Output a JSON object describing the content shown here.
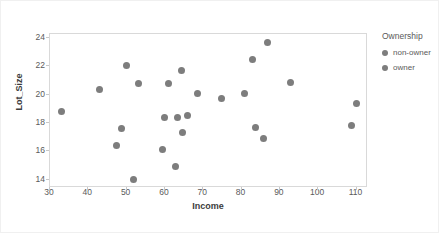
{
  "chart_data": {
    "type": "scatter",
    "title": "",
    "xlabel": "Income",
    "ylabel": "Lot_Size",
    "xlim": [
      30,
      113
    ],
    "ylim": [
      13.4,
      24.3
    ],
    "xticks": [
      "30",
      "40",
      "50",
      "60",
      "70",
      "80",
      "90",
      "100",
      "110"
    ],
    "yticks": [
      "14",
      "16",
      "18",
      "20",
      "22",
      "24"
    ],
    "grid": false,
    "legend": {
      "title": "Ownership",
      "position": "right",
      "entries": [
        {
          "label": "non-owner",
          "color": "#7d7d7d"
        },
        {
          "label": "owner",
          "color": "#7d7d7d"
        }
      ]
    },
    "marker_color": "#7d7d7d",
    "series": [
      {
        "name": "Ownership",
        "points": [
          {
            "x": 33.0,
            "y": 18.8
          },
          {
            "x": 43.0,
            "y": 20.4
          },
          {
            "x": 47.4,
            "y": 16.4
          },
          {
            "x": 48.6,
            "y": 17.6
          },
          {
            "x": 50.0,
            "y": 22.1
          },
          {
            "x": 51.8,
            "y": 14.0
          },
          {
            "x": 53.0,
            "y": 20.8
          },
          {
            "x": 59.4,
            "y": 16.1
          },
          {
            "x": 59.8,
            "y": 18.4
          },
          {
            "x": 61.0,
            "y": 20.8
          },
          {
            "x": 62.8,
            "y": 14.9
          },
          {
            "x": 63.2,
            "y": 18.4
          },
          {
            "x": 64.4,
            "y": 21.7
          },
          {
            "x": 64.6,
            "y": 17.3
          },
          {
            "x": 65.8,
            "y": 18.5
          },
          {
            "x": 68.6,
            "y": 20.1
          },
          {
            "x": 74.8,
            "y": 19.7
          },
          {
            "x": 80.8,
            "y": 20.1
          },
          {
            "x": 82.8,
            "y": 22.5
          },
          {
            "x": 83.6,
            "y": 17.7
          },
          {
            "x": 85.6,
            "y": 16.9
          },
          {
            "x": 86.8,
            "y": 23.7
          },
          {
            "x": 92.8,
            "y": 20.9
          },
          {
            "x": 108.6,
            "y": 17.8
          },
          {
            "x": 110.0,
            "y": 19.4
          }
        ]
      }
    ]
  }
}
